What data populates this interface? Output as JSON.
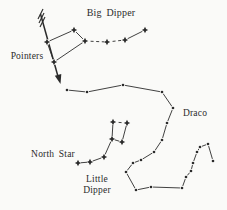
{
  "figure": {
    "background": "#fafaf8",
    "ink": "#2b2b2b",
    "labels": {
      "big_dipper": "Big Dipper",
      "pointers": "Pointers",
      "draco": "Draco",
      "north_star": "North Star",
      "little_line1": "Little",
      "little_line2": "Dipper"
    },
    "constellations": [
      {
        "name": "big-dipper",
        "marker": "star4",
        "stars": [
          [
            47,
            42
          ],
          [
            74,
            30
          ],
          [
            85,
            41
          ],
          [
            54,
            62
          ],
          [
            107,
            42
          ],
          [
            125,
            40
          ],
          [
            145,
            30
          ]
        ],
        "edges": [
          [
            0,
            1
          ],
          [
            1,
            2
          ],
          [
            2,
            3
          ],
          [
            3,
            0
          ],
          [
            2,
            4
          ],
          [
            4,
            5
          ],
          [
            5,
            6
          ]
        ],
        "dashed_edges": [
          [
            2,
            4
          ],
          [
            4,
            5
          ]
        ]
      },
      {
        "name": "little-dipper",
        "marker": "star4",
        "stars": [
          [
            78,
            163
          ],
          [
            90,
            162
          ],
          [
            104,
            157
          ],
          [
            112,
            139
          ],
          [
            113,
            122
          ],
          [
            127,
            123
          ],
          [
            122,
            142
          ]
        ],
        "edges": [
          [
            0,
            1
          ],
          [
            1,
            2
          ],
          [
            2,
            3
          ],
          [
            3,
            4
          ],
          [
            4,
            5
          ],
          [
            5,
            6
          ],
          [
            3,
            6
          ]
        ],
        "dashed_edges": [
          [
            4,
            5
          ]
        ]
      },
      {
        "name": "draco",
        "marker": "dot",
        "chain": true,
        "stars": [
          [
            67,
            90
          ],
          [
            87,
            92
          ],
          [
            123,
            85
          ],
          [
            162,
            92
          ],
          [
            173,
            108
          ],
          [
            167,
            123
          ],
          [
            162,
            140
          ],
          [
            154,
            152
          ],
          [
            141,
            160
          ],
          [
            133,
            163
          ],
          [
            126,
            172
          ],
          [
            136,
            190
          ],
          [
            151,
            187
          ],
          [
            182,
            188
          ],
          [
            186,
            177
          ],
          [
            191,
            171
          ],
          [
            193,
            163
          ],
          [
            197,
            152
          ],
          [
            200,
            147
          ],
          [
            208,
            144
          ],
          [
            213,
            161
          ]
        ]
      }
    ],
    "arrow": {
      "shaft": [
        [
          40.5,
          14
        ],
        [
          58,
          76.5
        ]
      ],
      "head": [
        [
          60.5,
          84
        ],
        [
          54.8,
          75.7
        ],
        [
          61.3,
          73.9
        ]
      ],
      "feathers": [
        [
          [
            38,
            19
          ],
          [
            43,
            9
          ]
        ],
        [
          [
            39,
            23
          ],
          [
            44,
            13
          ]
        ],
        [
          [
            40,
            27
          ],
          [
            45,
            17
          ]
        ]
      ]
    }
  }
}
